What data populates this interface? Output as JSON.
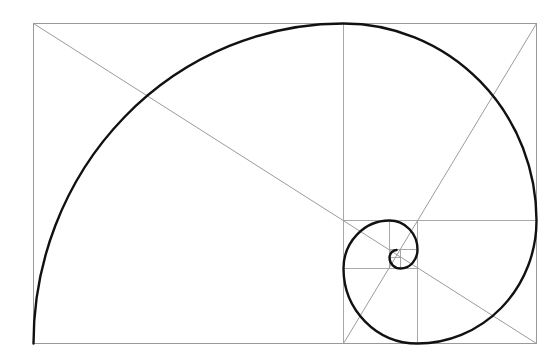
{
  "diagram": {
    "type": "golden-rectangle-spiral",
    "colors": {
      "background": "#ffffff",
      "frame": "#9a9a9a",
      "guides": "#a8a8a8",
      "spiral": "#111111"
    },
    "outer_rectangle": {
      "x": 33,
      "y": 23,
      "width": 503,
      "height": 320
    },
    "squares": [
      {
        "id": 1,
        "x": 33,
        "y": 23,
        "size": 310
      },
      {
        "id": 2,
        "x": 343,
        "y": 23,
        "size": 193
      },
      {
        "id": 3,
        "x": 417,
        "y": 220,
        "size": 119
      },
      {
        "id": 4,
        "x": 343,
        "y": 268,
        "size": 74
      },
      {
        "id": 5,
        "x": 343,
        "y": 220,
        "size": 46
      },
      {
        "id": 6,
        "x": 389,
        "y": 220,
        "size": 28
      },
      {
        "id": 7,
        "x": 399,
        "y": 249,
        "size": 18
      },
      {
        "id": 8,
        "x": 389,
        "y": 257,
        "size": 11
      }
    ],
    "diagonals": [
      {
        "from": [
          33,
          23
        ],
        "to": [
          536,
          343
        ]
      },
      {
        "from": [
          536,
          23
        ],
        "to": [
          343,
          343
        ]
      }
    ]
  }
}
